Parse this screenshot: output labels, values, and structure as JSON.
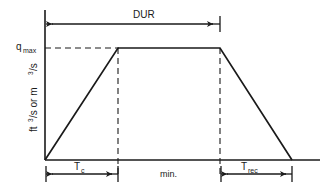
{
  "figure": {
    "type": "hydrograph-schematic",
    "title_visible": false,
    "background_color": "#ffffff",
    "line_color": "#1a1a1a",
    "text_color": "#1a1a1a"
  },
  "axes": {
    "y_label_parts": {
      "p1": "ft",
      "p1_sup": "3",
      "p2": "/s  or  m",
      "p2_sup": "3",
      "p3": "/s"
    },
    "y_label_full": "ft3/s or m3/s",
    "y_tick_label": "q",
    "y_tick_label_sub": "max",
    "y_tick_label_full": "qmax",
    "x_label": "min.",
    "x_axis_origin_px": {
      "x": 45,
      "y": 160
    },
    "y_axis_top_px": {
      "x": 45,
      "y": 10
    },
    "x_axis_end_px": {
      "x": 320,
      "y": 160
    }
  },
  "curve": {
    "name": "trapezoidal-hydrograph",
    "points_px": [
      {
        "x": 45,
        "y": 160
      },
      {
        "x": 118,
        "y": 48
      },
      {
        "x": 220,
        "y": 48
      },
      {
        "x": 292,
        "y": 160
      }
    ],
    "peak_level_px_y": 48,
    "rising_limb": "Tc",
    "plateau": "DUR minus Tc",
    "falling_limb": "Trec"
  },
  "guides": {
    "qmax_horizontal_dash": {
      "x1": 45,
      "y1": 48,
      "x2": 118,
      "y2": 48
    },
    "peak_start_vertical_dash": {
      "x": 118,
      "y1": 48,
      "y2": 176
    },
    "peak_end_vertical_dash": {
      "x": 220,
      "y1": 48,
      "y2": 176
    }
  },
  "dimensions": [
    {
      "id": "dur",
      "label": "DUR",
      "label_sub": "",
      "label_x": 133,
      "label_y": 18,
      "line_y": 24,
      "x_start": 46,
      "x_end": 220
    },
    {
      "id": "tc",
      "label": "T",
      "label_sub": "c",
      "label_x": 76,
      "label_y": 170,
      "line_y": 174,
      "x_start": 46,
      "x_end": 118
    },
    {
      "id": "trec",
      "label": "T",
      "label_sub": "rec",
      "label_x": 243,
      "label_y": 170,
      "line_y": 174,
      "x_start": 221,
      "x_end": 292
    }
  ],
  "annotations": {
    "x_axis_caption": "min.",
    "x_axis_caption_x": 169,
    "x_axis_caption_y": 177
  }
}
